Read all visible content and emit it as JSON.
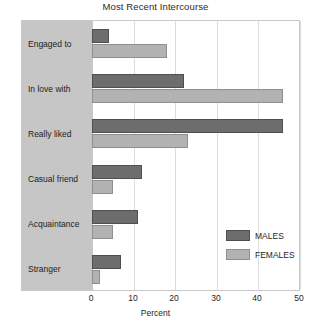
{
  "chart_data": {
    "type": "bar",
    "orientation": "horizontal",
    "title": "Most Recent Intercourse",
    "xlabel": "Percent",
    "ylabel": "",
    "xlim": [
      0,
      50
    ],
    "xticks": [
      0,
      10,
      20,
      30,
      40,
      50
    ],
    "xtick_labels": [
      "0",
      "10",
      "20",
      "30",
      "40",
      "50"
    ],
    "grid": true,
    "legend_position": "inside-lower-right",
    "categories": [
      "Engaged to",
      "In love with",
      "Really liked",
      "Casual friend",
      "Acquaintance",
      "Stranger"
    ],
    "series": [
      {
        "name": "MALES",
        "color": "#6d6d6d",
        "values": [
          4,
          22,
          46,
          12,
          11,
          7
        ]
      },
      {
        "name": "FEMALES",
        "color": "#b2b2b2",
        "values": [
          18,
          46,
          23,
          5,
          5,
          2
        ]
      }
    ]
  },
  "legend": {
    "items": [
      {
        "label": "MALES",
        "series": 0
      },
      {
        "label": "FEMALES",
        "series": 1
      }
    ]
  },
  "colors": {
    "males": "#6d6d6d",
    "females": "#b2b2b2",
    "label_band": "#c6c6c6",
    "gridline": "#dcdcdc",
    "frame": "#c9c9c9",
    "background": "#ffffff",
    "text": "#1d1d1d"
  }
}
